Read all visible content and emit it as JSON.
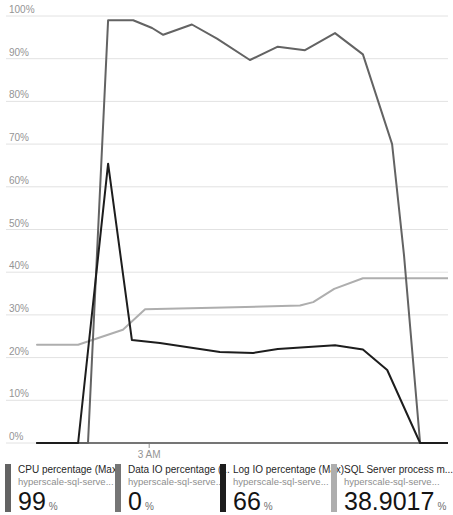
{
  "legend": {
    "items": [
      {
        "id": "cpu",
        "title": "CPU percentage (Max)",
        "resource": "hyperscale-sql-serve...",
        "value": "99",
        "unit": "%",
        "color": "#636363"
      },
      {
        "id": "data-io",
        "title": "Data IO percentage (...",
        "resource": "hyperscale-sql-serve...",
        "value": "0",
        "unit": "%",
        "color": "#757575"
      },
      {
        "id": "log-io",
        "title": "Log IO percentage (Max)",
        "resource": "hyperscale-sql-serve...",
        "value": "66",
        "unit": "%",
        "color": "#1d1d1d"
      },
      {
        "id": "sql-memory",
        "title": "SQL Server process m...",
        "resource": "hyperscale-sql-serve...",
        "value": "38.9017",
        "unit": "%",
        "color": "#aeaeae"
      }
    ]
  },
  "chart_data": {
    "type": "line",
    "title": "",
    "grid": "horizontal",
    "legend_position": "bottom",
    "y_axis": {
      "unit": "%",
      "min": 0,
      "max": 100,
      "step": 10,
      "tick_labels": [
        "100%",
        "90%",
        "80%",
        "70%",
        "60%",
        "50%",
        "40%",
        "30%",
        "20%",
        "10%",
        "0%"
      ],
      "label_color": "#949494",
      "grid_color": "#e2e2e2"
    },
    "x_axis": {
      "tick_labels": [
        "3 AM"
      ],
      "tick_positions_pct": [
        27.3
      ],
      "label_color": "#949494"
    },
    "series": [
      {
        "id": "sql-memory",
        "points": [
          [
            0,
            23
          ],
          [
            10,
            23
          ],
          [
            20.9,
            26.5
          ],
          [
            26.3,
            31.3
          ],
          [
            45.5,
            31.7
          ],
          [
            64,
            32.2
          ],
          [
            67.2,
            33
          ],
          [
            72.3,
            36.1
          ],
          [
            79.3,
            38.6
          ],
          [
            100,
            38.6
          ]
        ]
      },
      {
        "id": "data-io",
        "points": [
          [
            0,
            0
          ],
          [
            100,
            0
          ]
        ]
      },
      {
        "id": "cpu",
        "points": [
          [
            0,
            0
          ],
          [
            12.4,
            0
          ],
          [
            17.3,
            99
          ],
          [
            23.4,
            99
          ],
          [
            28,
            97.2
          ],
          [
            30.7,
            95.6
          ],
          [
            37.7,
            98
          ],
          [
            43.8,
            94.7
          ],
          [
            51.8,
            89.7
          ],
          [
            58.6,
            92.8
          ],
          [
            65.2,
            92
          ],
          [
            72.5,
            96
          ],
          [
            79.3,
            91
          ],
          [
            86.4,
            70
          ],
          [
            89.3,
            44
          ],
          [
            93.2,
            0
          ],
          [
            100,
            0
          ]
        ]
      },
      {
        "id": "log-io",
        "points": [
          [
            0,
            0
          ],
          [
            10,
            0
          ],
          [
            17.3,
            65.4
          ],
          [
            23.1,
            24.1
          ],
          [
            29.9,
            23.4
          ],
          [
            44.5,
            21.3
          ],
          [
            52.6,
            21.1
          ],
          [
            58.6,
            22
          ],
          [
            72.5,
            22.9
          ],
          [
            79.3,
            21.9
          ],
          [
            85.2,
            17.1
          ],
          [
            93.2,
            0
          ],
          [
            100,
            0
          ]
        ]
      }
    ]
  }
}
